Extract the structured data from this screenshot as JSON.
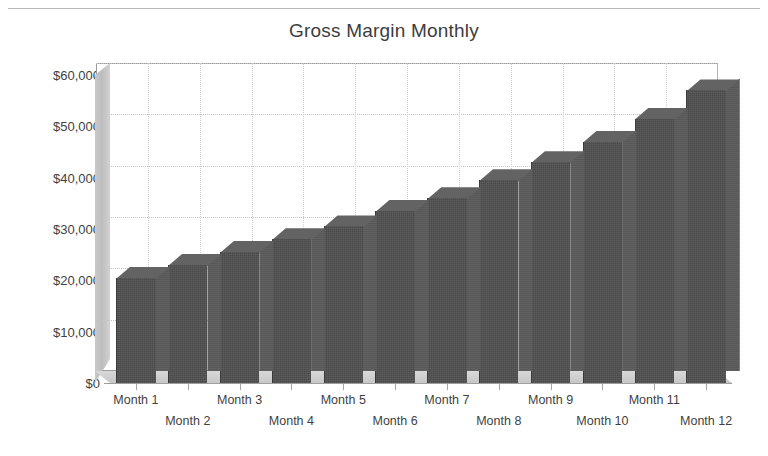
{
  "chart_data": {
    "type": "bar",
    "title": "Gross Margin Monthly",
    "xlabel": "",
    "ylabel": "",
    "categories": [
      "Month 1",
      "Month 2",
      "Month 3",
      "Month 4",
      "Month 5",
      "Month 6",
      "Month 7",
      "Month 8",
      "Month 9",
      "Month 10",
      "Month 11",
      "Month 12"
    ],
    "values": [
      20500,
      23000,
      25500,
      28000,
      30500,
      33500,
      36000,
      39500,
      43000,
      47000,
      51500,
      57000
    ],
    "ylim": [
      0,
      60000
    ],
    "ytick_values": [
      0,
      10000,
      20000,
      30000,
      40000,
      50000,
      60000
    ],
    "ytick_labels": [
      "$0",
      "$10,000",
      "$20,000",
      "$30,000",
      "$40,000",
      "$50,000",
      "$60,000"
    ],
    "grid": true,
    "legend": false,
    "legend_position": "none",
    "style": "3d-column",
    "series": [
      {
        "name": "Gross Margin",
        "values": [
          20500,
          23000,
          25500,
          28000,
          30500,
          33500,
          36000,
          39500,
          43000,
          47000,
          51500,
          57000
        ]
      }
    ]
  },
  "colors": {
    "bar_front": "#4a4a4a",
    "bar_side": "#585858",
    "bar_top": "#636363",
    "wall": "#c9c9c9",
    "grid": "#c4c4c4",
    "text": "#3f3f3f",
    "background": "#ffffff"
  }
}
